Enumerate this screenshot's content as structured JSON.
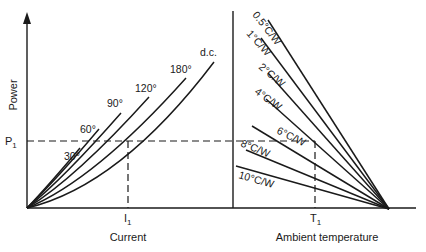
{
  "left_panel": {
    "y_axis_label": "Power",
    "x_axis_label": "Current",
    "p_marker": "P",
    "p_marker_sub": "1",
    "i_marker": "I",
    "i_marker_sub": "1",
    "curves": [
      {
        "label": "30°",
        "order": 0
      },
      {
        "label": "60°",
        "order": 1
      },
      {
        "label": "90°",
        "order": 2
      },
      {
        "label": "120°",
        "order": 3
      },
      {
        "label": "180°",
        "order": 4
      },
      {
        "label": "d.c.",
        "order": 5
      }
    ]
  },
  "right_panel": {
    "x_axis_label": "Ambient temperature",
    "t_marker": "T",
    "t_marker_sub": "1",
    "lines": [
      {
        "label": "0.5°C/W"
      },
      {
        "label": "1°C/W"
      },
      {
        "label": "2°C/W"
      },
      {
        "label": "4°C/W"
      },
      {
        "label": "6°C/W"
      },
      {
        "label": "8°C/W"
      },
      {
        "label": "10°C/W"
      }
    ]
  }
}
